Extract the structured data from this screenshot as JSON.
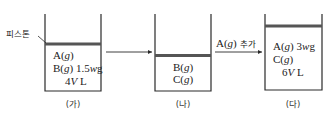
{
  "piston_label": "피스톤",
  "arrow_label": "A(g) 추가",
  "colors": {
    "line": "#2a2a2a",
    "piston": "#555555"
  },
  "containers": [
    {
      "label": "(가)",
      "lines": [
        "A(g)",
        "B(g) 1.5wg",
        "4VL"
      ],
      "parts": {
        "a": "A(",
        "a_g": "g",
        "a_close": ")",
        "b": "B(",
        "b_g": "g",
        "b_close": ") 1.5",
        "b_w": "w",
        "b_unit": "g",
        "vol_num": "4",
        "vol_v": "V",
        "vol_unit": " L"
      }
    },
    {
      "label": "(나)",
      "lines": [
        "B(g)",
        "C(g)"
      ],
      "parts": {
        "b": "B(",
        "b_g": "g",
        "b_close": ")",
        "c": "C(",
        "c_g": "g",
        "c_close": ")"
      }
    },
    {
      "label": "(다)",
      "lines": [
        "A(g) 3wg",
        "C(g)",
        "6VL"
      ],
      "parts": {
        "a": "A(",
        "a_g": "g",
        "a_close": ") 3",
        "a_w": "w",
        "a_unit": "g",
        "c": "C(",
        "c_g": "g",
        "c_close": ")",
        "vol_num": "6",
        "vol_v": "V",
        "vol_unit": " L"
      }
    }
  ]
}
